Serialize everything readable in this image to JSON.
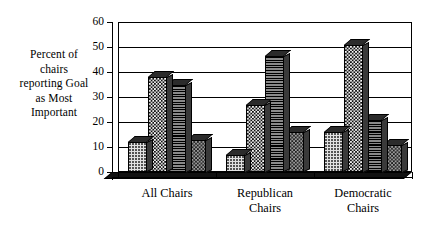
{
  "chart_data": {
    "type": "bar",
    "title": "",
    "subtitle": "",
    "xlabel": "",
    "ylabel": "Percent of chairs reporting Goal as Most Important",
    "ylabel_lines": [
      "Percent of",
      "chairs",
      "reporting Goal",
      "as Most",
      "Important"
    ],
    "categories": [
      "All Chairs",
      "Republican Chairs",
      "Democratic Chairs"
    ],
    "category_lines": [
      [
        "All Chairs"
      ],
      [
        "Republican",
        "Chairs"
      ],
      [
        "Democratic",
        "Chairs"
      ]
    ],
    "series": [
      {
        "name": "Series 1",
        "pattern": "light-stipple",
        "values": [
          12,
          7,
          16
        ]
      },
      {
        "name": "Series 2",
        "pattern": "dense-checkerboard",
        "values": [
          38,
          27,
          51
        ]
      },
      {
        "name": "Series 3",
        "pattern": "horizontal-lines",
        "values": [
          35,
          46.5,
          21
        ]
      },
      {
        "name": "Series 4",
        "pattern": "medium-checkerboard",
        "values": [
          13,
          16,
          11
        ]
      }
    ],
    "ylim": [
      0,
      60
    ],
    "ytick_labels": [
      "0",
      "10",
      "20",
      "30",
      "40",
      "50",
      "60"
    ],
    "ytick_values": [
      0,
      10,
      20,
      30,
      40,
      50,
      60
    ],
    "grid": true,
    "grid_axis": "y",
    "legend": "none",
    "style_3d": true,
    "colors": {
      "background": "#ffffff",
      "axis": "#000000",
      "grid": "#000000",
      "bar_side": "#3a3a3a",
      "bar_top": "#2b2b2b"
    }
  }
}
